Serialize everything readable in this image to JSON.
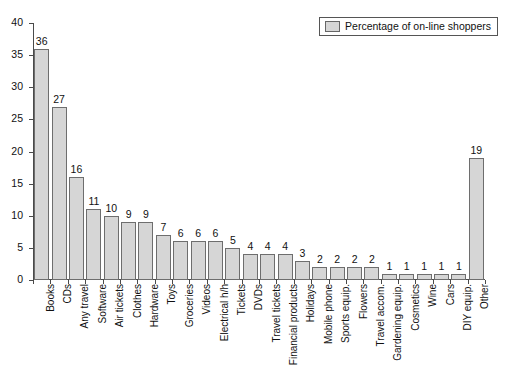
{
  "chart_data": {
    "type": "bar",
    "title": "",
    "subtitle": "",
    "xlabel": "",
    "ylabel": "",
    "ylim": [
      0,
      40
    ],
    "yticks": [
      0,
      5,
      10,
      15,
      20,
      25,
      30,
      35,
      40
    ],
    "grid": false,
    "legend_position": "top-right",
    "legend": [
      "Percentage of on-line shoppers"
    ],
    "bar_color": "#d6d6d6",
    "bar_edge_color": "#6e6e6e",
    "categories": [
      "Books",
      "CDs",
      "Any travel",
      "Software",
      "Air tickets",
      "Clothes",
      "Hardware",
      "Toys",
      "Groceries",
      "Videos",
      "Electrical h/h",
      "Tickets",
      "DVDs",
      "Travel tickets",
      "Financial products",
      "Holidays",
      "Mobile phone",
      "Sports equip.",
      "Flowers",
      "Travel accom.",
      "Gardening equip.",
      "Cosmetics",
      "Wine",
      "Cars",
      "DIY equip.",
      "Other"
    ],
    "values": [
      36,
      27,
      16,
      11,
      10,
      9,
      9,
      7,
      6,
      6,
      6,
      5,
      4,
      4,
      4,
      3,
      2,
      2,
      2,
      2,
      1,
      1,
      1,
      1,
      1,
      19
    ],
    "series": [
      {
        "name": "Percentage of on-line shoppers",
        "values": [
          36,
          27,
          16,
          11,
          10,
          9,
          9,
          7,
          6,
          6,
          6,
          5,
          4,
          4,
          4,
          3,
          2,
          2,
          2,
          2,
          1,
          1,
          1,
          1,
          1,
          19
        ]
      }
    ]
  }
}
